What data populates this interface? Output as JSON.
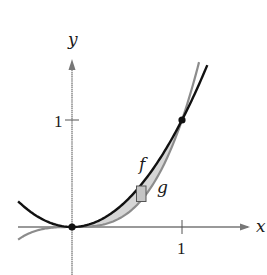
{
  "figure": {
    "axes": {
      "x_label": "x",
      "y_label": "y",
      "x_tick_label": "1",
      "y_tick_label": "1"
    },
    "curves": [
      {
        "name": "f",
        "label": "f",
        "expression": "x^2",
        "color": "#111111"
      },
      {
        "name": "g",
        "label": "g",
        "expression": "x^3",
        "color": "#8c8c8c"
      }
    ],
    "intersection_points": [
      {
        "x": 0,
        "y": 0
      },
      {
        "x": 1,
        "y": 1
      }
    ],
    "region_fill": "#d6d6d6",
    "representative_rectangle": {
      "fill": "#c4c4c4",
      "stroke": "#555555"
    }
  }
}
